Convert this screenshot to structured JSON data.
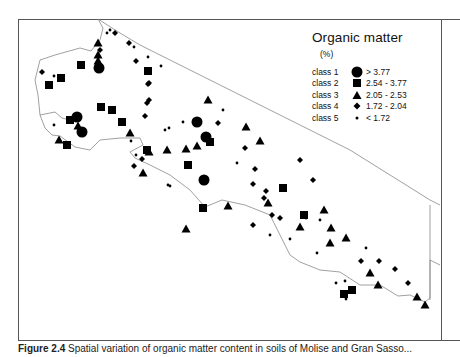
{
  "legend": {
    "title": "Organic matter",
    "unit": "(%)",
    "classes": [
      {
        "label": "class 1",
        "symbol": "circle",
        "range": "> 3.77"
      },
      {
        "label": "class 2",
        "symbol": "square",
        "range": "2.54 - 3.77"
      },
      {
        "label": "class 3",
        "symbol": "triangle",
        "range": "2.05 - 2.53"
      },
      {
        "label": "class 4",
        "symbol": "diamond",
        "range": "1.72 - 2.04"
      },
      {
        "label": "class 5",
        "symbol": "dot",
        "range": "< 1.72"
      }
    ]
  },
  "caption": {
    "label": "Figure 2.4",
    "text": "Spatial variation of organic matter content in soils of Molise and Gran Sasso..."
  },
  "chart_data": {
    "type": "scatter",
    "title": "Organic matter (%)",
    "xlabel": "",
    "ylabel": "",
    "grid": false,
    "legend_position": "top-right",
    "symbol_classes": {
      "1": "circle",
      "2": "square",
      "3": "triangle",
      "4": "diamond",
      "5": "dot"
    },
    "points": [
      {
        "x": 99,
        "y": 68,
        "c": 1
      },
      {
        "x": 77,
        "y": 117,
        "c": 1
      },
      {
        "x": 82,
        "y": 132,
        "c": 1
      },
      {
        "x": 197,
        "y": 122,
        "c": 1
      },
      {
        "x": 206,
        "y": 137,
        "c": 1
      },
      {
        "x": 204,
        "y": 180,
        "c": 1
      },
      {
        "x": 81,
        "y": 65,
        "c": 2
      },
      {
        "x": 61,
        "y": 78,
        "c": 2
      },
      {
        "x": 49,
        "y": 85,
        "c": 2
      },
      {
        "x": 147,
        "y": 150,
        "c": 2
      },
      {
        "x": 148,
        "y": 71,
        "c": 2
      },
      {
        "x": 101,
        "y": 107,
        "c": 2
      },
      {
        "x": 112,
        "y": 110,
        "c": 2
      },
      {
        "x": 70,
        "y": 120,
        "c": 2
      },
      {
        "x": 67,
        "y": 145,
        "c": 2
      },
      {
        "x": 122,
        "y": 122,
        "c": 2
      },
      {
        "x": 210,
        "y": 142,
        "c": 2
      },
      {
        "x": 188,
        "y": 165,
        "c": 2
      },
      {
        "x": 203,
        "y": 208,
        "c": 2
      },
      {
        "x": 283,
        "y": 188,
        "c": 2
      },
      {
        "x": 344,
        "y": 294,
        "c": 2
      },
      {
        "x": 304,
        "y": 215,
        "c": 2
      },
      {
        "x": 352,
        "y": 290,
        "c": 2
      },
      {
        "x": 98,
        "y": 43,
        "c": 3
      },
      {
        "x": 98,
        "y": 55,
        "c": 3
      },
      {
        "x": 98,
        "y": 61,
        "c": 3
      },
      {
        "x": 78,
        "y": 126,
        "c": 3
      },
      {
        "x": 130,
        "y": 133,
        "c": 3
      },
      {
        "x": 59,
        "y": 140,
        "c": 3
      },
      {
        "x": 208,
        "y": 100,
        "c": 3
      },
      {
        "x": 246,
        "y": 127,
        "c": 3
      },
      {
        "x": 260,
        "y": 141,
        "c": 3
      },
      {
        "x": 186,
        "y": 149,
        "c": 3
      },
      {
        "x": 197,
        "y": 146,
        "c": 3
      },
      {
        "x": 167,
        "y": 150,
        "c": 3
      },
      {
        "x": 149,
        "y": 152,
        "c": 3
      },
      {
        "x": 143,
        "y": 173,
        "c": 3
      },
      {
        "x": 228,
        "y": 206,
        "c": 3
      },
      {
        "x": 268,
        "y": 203,
        "c": 3
      },
      {
        "x": 300,
        "y": 227,
        "c": 3
      },
      {
        "x": 186,
        "y": 229,
        "c": 3
      },
      {
        "x": 331,
        "y": 228,
        "c": 3
      },
      {
        "x": 346,
        "y": 238,
        "c": 3
      },
      {
        "x": 370,
        "y": 273,
        "c": 3
      },
      {
        "x": 378,
        "y": 285,
        "c": 3
      },
      {
        "x": 417,
        "y": 297,
        "c": 3
      },
      {
        "x": 425,
        "y": 305,
        "c": 3
      },
      {
        "x": 324,
        "y": 210,
        "c": 3
      },
      {
        "x": 330,
        "y": 243,
        "c": 3
      },
      {
        "x": 42,
        "y": 72,
        "c": 4
      },
      {
        "x": 100,
        "y": 50,
        "c": 4
      },
      {
        "x": 115,
        "y": 33,
        "c": 4
      },
      {
        "x": 129,
        "y": 43,
        "c": 4
      },
      {
        "x": 136,
        "y": 61,
        "c": 4
      },
      {
        "x": 149,
        "y": 83,
        "c": 4
      },
      {
        "x": 149,
        "y": 100,
        "c": 4
      },
      {
        "x": 145,
        "y": 116,
        "c": 4
      },
      {
        "x": 148,
        "y": 84,
        "c": 4
      },
      {
        "x": 147,
        "y": 103,
        "c": 4
      },
      {
        "x": 218,
        "y": 123,
        "c": 4
      },
      {
        "x": 245,
        "y": 148,
        "c": 4
      },
      {
        "x": 255,
        "y": 169,
        "c": 4
      },
      {
        "x": 266,
        "y": 191,
        "c": 4
      },
      {
        "x": 253,
        "y": 184,
        "c": 4
      },
      {
        "x": 280,
        "y": 218,
        "c": 4
      },
      {
        "x": 253,
        "y": 225,
        "c": 4
      },
      {
        "x": 264,
        "y": 198,
        "c": 4
      },
      {
        "x": 300,
        "y": 160,
        "c": 4
      },
      {
        "x": 313,
        "y": 180,
        "c": 4
      },
      {
        "x": 272,
        "y": 215,
        "c": 4
      },
      {
        "x": 361,
        "y": 261,
        "c": 4
      },
      {
        "x": 379,
        "y": 261,
        "c": 4
      },
      {
        "x": 395,
        "y": 269,
        "c": 4
      },
      {
        "x": 408,
        "y": 283,
        "c": 4
      },
      {
        "x": 134,
        "y": 166,
        "c": 4
      },
      {
        "x": 142,
        "y": 159,
        "c": 4
      },
      {
        "x": 54,
        "y": 76,
        "c": 5
      },
      {
        "x": 107,
        "y": 33,
        "c": 5
      },
      {
        "x": 110,
        "y": 30,
        "c": 5
      },
      {
        "x": 134,
        "y": 47,
        "c": 5
      },
      {
        "x": 148,
        "y": 57,
        "c": 5
      },
      {
        "x": 161,
        "y": 66,
        "c": 5
      },
      {
        "x": 54,
        "y": 125,
        "c": 5
      },
      {
        "x": 131,
        "y": 141,
        "c": 5
      },
      {
        "x": 136,
        "y": 155,
        "c": 5
      },
      {
        "x": 169,
        "y": 128,
        "c": 5
      },
      {
        "x": 223,
        "y": 110,
        "c": 5
      },
      {
        "x": 183,
        "y": 122,
        "c": 5
      },
      {
        "x": 165,
        "y": 130,
        "c": 5
      },
      {
        "x": 170,
        "y": 186,
        "c": 5
      },
      {
        "x": 168,
        "y": 185,
        "c": 5
      },
      {
        "x": 237,
        "y": 163,
        "c": 5
      },
      {
        "x": 270,
        "y": 235,
        "c": 5
      },
      {
        "x": 290,
        "y": 239,
        "c": 5
      },
      {
        "x": 306,
        "y": 218,
        "c": 5
      },
      {
        "x": 320,
        "y": 220,
        "c": 5
      },
      {
        "x": 366,
        "y": 248,
        "c": 5
      },
      {
        "x": 345,
        "y": 281,
        "c": 5
      },
      {
        "x": 346,
        "y": 299,
        "c": 5
      },
      {
        "x": 317,
        "y": 253,
        "c": 5
      },
      {
        "x": 336,
        "y": 283,
        "c": 5
      }
    ]
  }
}
